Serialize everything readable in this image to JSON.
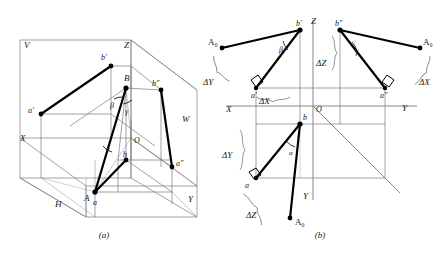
{
  "figure": {
    "captions": {
      "a": "(a)",
      "b": "(b)"
    },
    "colors": {
      "thick_line": "#000000",
      "thin_line": "#7a7a7a",
      "projection_plane": "#8a8a8a",
      "text": "#1a1a1a",
      "background": "#ffffff"
    }
  },
  "panel_a": {
    "name": "axonometric-pictorial",
    "plane_labels": [
      {
        "text": "V",
        "x": 24,
        "y": 43
      },
      {
        "text": "W",
        "x": 186,
        "y": 119
      },
      {
        "text": "H",
        "x": 58,
        "y": 203
      }
    ],
    "axis_labels": [
      {
        "text": "X",
        "x": 22,
        "y": 137
      },
      {
        "text": "Y",
        "x": 189,
        "y": 198
      },
      {
        "text": "Z",
        "x": 125,
        "y": 44
      },
      {
        "text": "O",
        "x": 131,
        "y": 146
      }
    ],
    "point_labels": [
      {
        "text": "b′",
        "x": 102,
        "y": 58
      },
      {
        "text": "B",
        "x": 126,
        "y": 78
      },
      {
        "text": "b″",
        "x": 153,
        "y": 86
      },
      {
        "text": "a′",
        "x": 31,
        "y": 111
      },
      {
        "text": "A",
        "x": 86,
        "y": 178
      },
      {
        "text": "b",
        "x": 125,
        "y": 163
      },
      {
        "text": "a″",
        "x": 180,
        "y": 166
      },
      {
        "text": "a",
        "x": 95,
        "y": 202
      }
    ],
    "angle_labels": [
      {
        "text": "β",
        "x": 112,
        "y": 104
      },
      {
        "text": "γ",
        "x": 126,
        "y": 110
      },
      {
        "text": "α",
        "x": 108,
        "y": 148
      }
    ]
  },
  "panel_b": {
    "name": "orthographic-multiview",
    "axis_labels": [
      {
        "text": "Z",
        "x": 316,
        "y": 22
      },
      {
        "text": "X",
        "x": 227,
        "y": 110
      },
      {
        "text": "O",
        "x": 312,
        "y": 110
      },
      {
        "text": "Y",
        "x": 404,
        "y": 108
      },
      {
        "text": "Y",
        "x": 305,
        "y": 196
      }
    ],
    "point_labels": [
      {
        "text": "A₀",
        "x": 211,
        "y": 45
      },
      {
        "text": "b′",
        "x": 301,
        "y": 33
      },
      {
        "text": "b″",
        "x": 337,
        "y": 33
      },
      {
        "text": "A₀",
        "x": 424,
        "y": 45
      },
      {
        "text": "a′",
        "x": 256,
        "y": 96
      },
      {
        "text": "a″",
        "x": 385,
        "y": 96
      },
      {
        "text": "b",
        "x": 305,
        "y": 129
      },
      {
        "text": "a",
        "x": 242,
        "y": 186
      },
      {
        "text": "A₀",
        "x": 295,
        "y": 223
      }
    ],
    "angle_labels": [
      {
        "text": "β",
        "x": 281,
        "y": 47
      },
      {
        "text": "γ",
        "x": 357,
        "y": 48
      },
      {
        "text": "α",
        "x": 291,
        "y": 152
      }
    ],
    "dimension_labels": [
      {
        "text": "ΔY",
        "x": 209,
        "y": 81,
        "name": "delta-y-upper-left"
      },
      {
        "text": "ΔZ",
        "x": 322,
        "y": 62,
        "name": "delta-z-upper-middle"
      },
      {
        "text": "ΔX",
        "x": 424,
        "y": 81,
        "name": "delta-x-upper-right"
      },
      {
        "text": "ΔX",
        "x": 265,
        "y": 101,
        "name": "delta-x-lower-axis"
      },
      {
        "text": "ΔY",
        "x": 228,
        "y": 155,
        "name": "delta-y-lower-left"
      },
      {
        "text": "ΔZ",
        "x": 252,
        "y": 214,
        "name": "delta-z-lower-left"
      }
    ]
  }
}
